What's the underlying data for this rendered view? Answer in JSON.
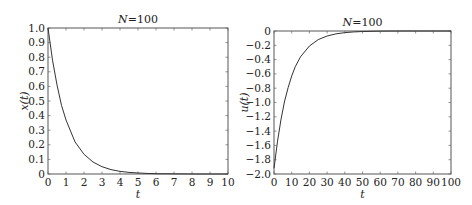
{
  "chart_data": [
    {
      "type": "line",
      "title": "N=100",
      "title_parts": {
        "var": "N",
        "rest": "=100"
      },
      "xlabel": "t",
      "ylabel": "x(t)",
      "xlim": [
        0,
        10
      ],
      "ylim": [
        0,
        1.0
      ],
      "xticks": [
        "0",
        "1",
        "2",
        "3",
        "4",
        "5",
        "6",
        "7",
        "8",
        "9",
        "10"
      ],
      "yticks": [
        "0",
        "0.1",
        "0.2",
        "0.3",
        "0.4",
        "0.5",
        "0.6",
        "0.7",
        "0.8",
        "0.9",
        "1.0"
      ],
      "grid": false,
      "series": [
        {
          "name": "x(t)",
          "x": [
            0,
            0.25,
            0.5,
            0.75,
            1,
            1.5,
            2,
            2.5,
            3,
            3.5,
            4,
            4.5,
            5,
            5.5,
            6,
            7,
            8,
            9,
            10
          ],
          "values": [
            1.0,
            0.78,
            0.61,
            0.47,
            0.37,
            0.22,
            0.135,
            0.082,
            0.05,
            0.03,
            0.018,
            0.011,
            0.007,
            0.004,
            0.002,
            0.001,
            0,
            0,
            0
          ]
        }
      ],
      "box": {
        "left": 48,
        "top": 28,
        "right": 228,
        "bottom": 174
      }
    },
    {
      "type": "line",
      "title": "N=100",
      "title_parts": {
        "var": "N",
        "rest": "=100"
      },
      "xlabel": "t",
      "ylabel": "u(t)",
      "xlim": [
        0,
        100
      ],
      "ylim": [
        -2.0,
        0
      ],
      "xticks": [
        "0",
        "10",
        "20",
        "30",
        "40",
        "50",
        "60",
        "70",
        "80",
        "90",
        "100"
      ],
      "yticks": [
        "−2.0",
        "−1.8",
        "−1.6",
        "−1.4",
        "−1.2",
        "−1.0",
        "−0.8",
        "−0.6",
        "−0.4",
        "−0.2",
        "0"
      ],
      "grid": false,
      "series": [
        {
          "name": "u(t)",
          "x": [
            0,
            2,
            4,
            6,
            8,
            10,
            12,
            15,
            20,
            25,
            30,
            35,
            40,
            45,
            50,
            60,
            70,
            80,
            90,
            100
          ],
          "values": [
            -1.92,
            -1.54,
            -1.23,
            -0.98,
            -0.79,
            -0.63,
            -0.5,
            -0.36,
            -0.21,
            -0.12,
            -0.07,
            -0.04,
            -0.023,
            -0.013,
            -0.007,
            -0.002,
            0,
            0,
            0,
            0
          ]
        }
      ],
      "box": {
        "left": 274,
        "top": 31,
        "right": 451,
        "bottom": 174
      }
    }
  ]
}
